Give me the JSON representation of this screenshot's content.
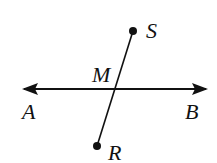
{
  "diagram": {
    "points": [
      {
        "id": "S",
        "label": "S",
        "x": 133,
        "y": 31
      },
      {
        "id": "R",
        "label": "R",
        "x": 97,
        "y": 146
      },
      {
        "id": "M",
        "label": "M",
        "x": 115,
        "y": 89
      }
    ],
    "line": {
      "name": "AB",
      "left_label": "A",
      "right_label": "B",
      "y": 89,
      "x1": 22,
      "x2": 208,
      "arrows": "both"
    },
    "segment": {
      "name": "RS",
      "from": "R",
      "to": "S"
    },
    "colors": {
      "stroke": "#111111",
      "background": "#ffffff"
    }
  }
}
